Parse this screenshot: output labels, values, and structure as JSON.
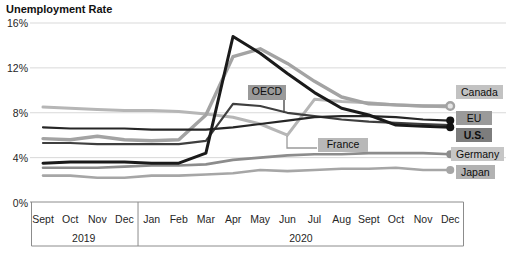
{
  "title": "Unemployment Rate",
  "y_axis": {
    "ticks": [
      {
        "label": "16%",
        "value": 16
      },
      {
        "label": "12%",
        "value": 12
      },
      {
        "label": "8%",
        "value": 8
      },
      {
        "label": "4%",
        "value": 4
      },
      {
        "label": "0%",
        "value": 0
      }
    ]
  },
  "x_axis": {
    "months": [
      "Sept",
      "Oct",
      "Nov",
      "Dec",
      "Jan",
      "Feb",
      "Mar",
      "Apr",
      "May",
      "Jun",
      "Jul",
      "Aug",
      "Sept",
      "Oct",
      "Nov",
      "Dec"
    ],
    "year_groups": [
      {
        "label": "2019",
        "start": 0,
        "count": 4
      },
      {
        "label": "2020",
        "start": 4,
        "count": 12
      }
    ]
  },
  "chart_data": {
    "type": "line",
    "title": "Unemployment Rate",
    "x_labels": [
      "Sept 2019",
      "Oct 2019",
      "Nov 2019",
      "Dec 2019",
      "Jan 2020",
      "Feb 2020",
      "Mar 2020",
      "Apr 2020",
      "May 2020",
      "Jun 2020",
      "Jul 2020",
      "Aug 2020",
      "Sept 2020",
      "Oct 2020",
      "Nov 2020",
      "Dec 2020"
    ],
    "ylim": [
      0,
      16
    ],
    "grid": true,
    "gridline_color": "#d9d9d9",
    "axis_color": "#8c8c8c",
    "series": [
      {
        "name": "France",
        "color": "#b6b6b6",
        "width": 3,
        "marker": null,
        "values": [
          8.5,
          8.4,
          8.3,
          8.2,
          8.2,
          8.1,
          7.9,
          7.6,
          7.0,
          6.0,
          9.2,
          9.0,
          8.9,
          8.7,
          8.6,
          8.5
        ],
        "end_label": null
      },
      {
        "name": "Japan",
        "color": "#a6a6a6",
        "width": 2.6,
        "marker": "filled",
        "values": [
          2.4,
          2.4,
          2.2,
          2.2,
          2.4,
          2.4,
          2.5,
          2.6,
          2.9,
          2.8,
          2.9,
          3.0,
          3.0,
          3.1,
          2.9,
          2.9
        ],
        "end_label": {
          "text": "Japan",
          "bg": "#b2b2b2",
          "dy": 2,
          "bold": false
        }
      },
      {
        "name": "Germany",
        "color": "#8c8c8c",
        "width": 2.6,
        "marker": "filled",
        "values": [
          3.1,
          3.1,
          3.1,
          3.2,
          3.3,
          3.3,
          3.4,
          3.8,
          4.0,
          4.2,
          4.3,
          4.3,
          4.4,
          4.4,
          4.4,
          4.3
        ],
        "end_label": {
          "text": "Germany",
          "bg": "#c6c6c6",
          "dy": 0,
          "bold": false
        }
      },
      {
        "name": "Canada",
        "color": "#a3a3a3",
        "width": 3.4,
        "marker": "open",
        "values": [
          5.7,
          5.6,
          5.9,
          5.6,
          5.5,
          5.6,
          7.8,
          13.0,
          13.7,
          12.4,
          10.8,
          9.4,
          8.8,
          8.7,
          8.6,
          8.6
        ],
        "end_label": {
          "text": "Canada",
          "bg": "#c2c2c2",
          "dy": -14,
          "bold": false
        }
      },
      {
        "name": "OECD",
        "color": "#3f3f3f",
        "width": 2.2,
        "marker": null,
        "values": [
          5.3,
          5.3,
          5.2,
          5.2,
          5.2,
          5.2,
          5.5,
          8.8,
          8.6,
          8.0,
          7.7,
          7.4,
          7.2,
          7.1,
          7.0,
          6.9
        ],
        "end_label": null
      },
      {
        "name": "EU",
        "color": "#262626",
        "width": 2.2,
        "marker": "filled",
        "values": [
          6.7,
          6.6,
          6.6,
          6.6,
          6.5,
          6.5,
          6.5,
          6.7,
          7.0,
          7.3,
          7.6,
          7.7,
          7.7,
          7.6,
          7.4,
          7.3
        ],
        "end_label": {
          "text": "EU",
          "bg": "#9a9a9a",
          "dy": -3,
          "bold": false
        }
      },
      {
        "name": "U.S.",
        "color": "#1a1a1a",
        "width": 3,
        "marker": "filled",
        "values": [
          3.5,
          3.6,
          3.6,
          3.6,
          3.5,
          3.5,
          4.4,
          14.8,
          13.3,
          11.5,
          9.8,
          8.4,
          7.8,
          6.9,
          6.8,
          6.7
        ],
        "end_label": {
          "text": "U.S.",
          "bg": "#7d7d7d",
          "dy": 8,
          "bold": true
        }
      }
    ],
    "annotations": [
      {
        "name": "OECD",
        "text": "OECD",
        "bg": "#9a9a9a",
        "box": {
          "x": 248,
          "y": 85,
          "w": 38,
          "h": 15
        },
        "leader": [
          [
            284,
            100
          ],
          [
            284,
            113
          ]
        ],
        "leader_color": "#3f3f3f"
      },
      {
        "name": "France",
        "text": "France",
        "bg": "#b8b8b8",
        "box": {
          "x": 318,
          "y": 138,
          "w": 50,
          "h": 14
        },
        "leader": [
          [
            287,
            136
          ],
          [
            287,
            148
          ],
          [
            317,
            148
          ]
        ],
        "leader_color": "#9a9a9a"
      }
    ]
  },
  "layout_hint": {
    "legend_position": "right-edge-data-labels"
  }
}
